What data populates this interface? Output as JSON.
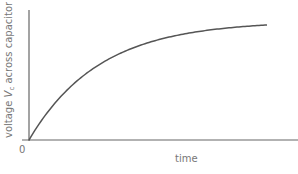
{
  "chart_data": {
    "type": "line",
    "title": "",
    "xlabel": "time",
    "ylabel": "voltage V_c across capacitor",
    "ylabel_parts": {
      "pre": "voltage ",
      "var": "V",
      "sub": "c",
      "post": " across capacitor"
    },
    "origin_label": "0",
    "grid": false,
    "legend": null,
    "series": [
      {
        "name": "capacitor charging",
        "shape": "exponential rise 1 - e^(-t/RC)",
        "color": "#555555"
      }
    ],
    "x_ticks": [],
    "y_ticks": []
  },
  "colors": {
    "axis": "#666666",
    "curve": "#555555",
    "text": "#777777"
  }
}
